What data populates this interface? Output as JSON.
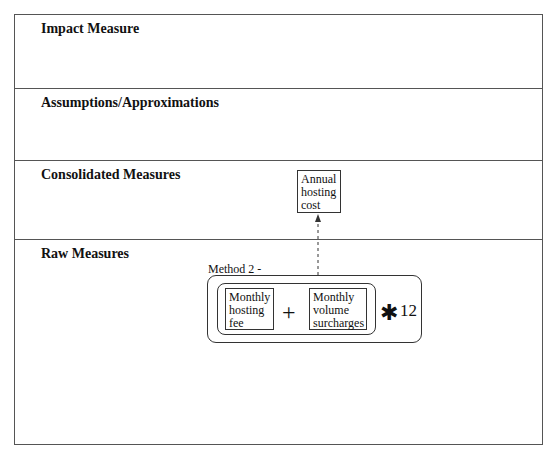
{
  "bands": [
    {
      "title": "Impact Measure"
    },
    {
      "title": "Assumptions/Approximations"
    },
    {
      "title": "Consolidated Measures"
    },
    {
      "title": "Raw Measures"
    }
  ],
  "consolidated": {
    "annual_hosting_cost": "Annual\nhosting\ncost"
  },
  "method": {
    "label": "Method 2 -",
    "left_term": "Monthly\nhosting\nfee",
    "operator": "+",
    "right_term": "Monthly\nvolume\nsurcharges",
    "multiplier_symbol": "✱",
    "multiplier_value": "12"
  },
  "colors": {
    "line": "#333333",
    "frame": "#555555"
  }
}
